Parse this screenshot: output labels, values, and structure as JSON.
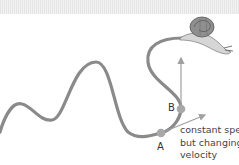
{
  "diagram": {
    "point_a_label": "A",
    "point_b_label": "B",
    "annotation": {
      "line1": "constant speed",
      "line2": "but changing",
      "line3": "velocity"
    },
    "colors": {
      "path": "#8a8a8a",
      "points": "#a8a8a8",
      "arrows": "#a0a0a0",
      "text": "#333333"
    },
    "icons": {
      "snail": "snail-icon"
    }
  }
}
